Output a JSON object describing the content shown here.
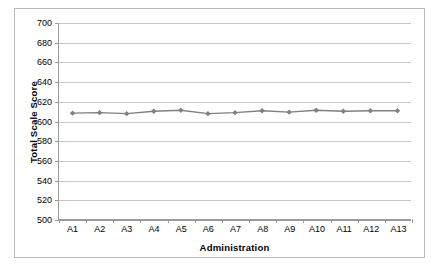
{
  "chart_data": {
    "type": "line",
    "title": "",
    "xlabel": "Administration",
    "ylabel": "Total Scale Score",
    "categories": [
      "A1",
      "A2",
      "A3",
      "A4",
      "A5",
      "A6",
      "A7",
      "A8",
      "A9",
      "A10",
      "A11",
      "A12",
      "A13"
    ],
    "values": [
      608,
      608.5,
      607.5,
      610,
      611,
      607.5,
      608.5,
      610.5,
      609,
      611,
      610,
      610.5,
      610.5
    ],
    "series": [
      {
        "name": "Total Scale Score",
        "values": [
          608,
          608.5,
          607.5,
          610,
          611,
          607.5,
          608.5,
          610.5,
          609,
          611,
          610,
          610.5,
          610.5
        ]
      }
    ],
    "ylim": [
      500,
      700
    ],
    "ytick_step": 20,
    "ytick_labels": [
      "700",
      "680",
      "660",
      "640",
      "620",
      "600",
      "580",
      "560",
      "540",
      "520",
      "500"
    ],
    "ytick_values": [
      700,
      680,
      660,
      640,
      620,
      600,
      580,
      560,
      540,
      520,
      500
    ],
    "grid": "horizontal",
    "legend": "none",
    "marker": "diamond",
    "line_color": "#808080",
    "marker_color": "#808080",
    "grid_color": "#c6c6c6",
    "axis_color": "#9a9a9a",
    "border_color": "#b9b9b9",
    "text_color": "#000000"
  }
}
